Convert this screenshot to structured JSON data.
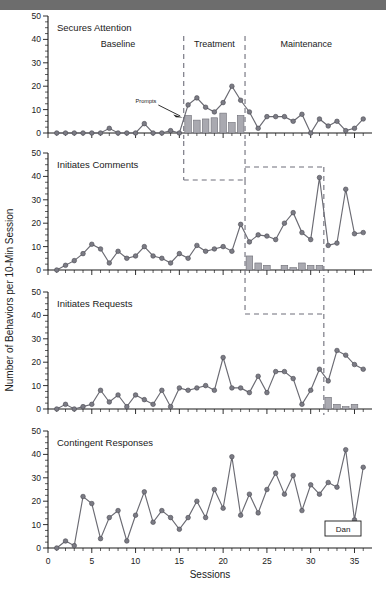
{
  "figure": {
    "ylabel": "Number of Behaviors per 10-Min Session",
    "xlabel": "Sessions",
    "subject_label": "Dan",
    "prompts_label": "Prompts",
    "colors": {
      "line": "#6b6b73",
      "marker": "#7b7b84",
      "bar": "#a9a9b0",
      "phase_line": "#6e6e7a",
      "axis": "#1a1a1a",
      "top_band": "#6d6d6d"
    }
  },
  "chart_data": [
    {
      "type": "line",
      "title": "Secures Attention",
      "panel_index": 0,
      "xlabel": "",
      "ylabel": "Number of Behaviors per 10-Min Session",
      "xlim": [
        0,
        37
      ],
      "ylim": [
        0,
        50
      ],
      "yticks": [
        0,
        10,
        20,
        30,
        40,
        50
      ],
      "grid": false,
      "phase_labels": [
        "Baseline",
        "Treatment",
        "Maintenance"
      ],
      "phase_label_x": [
        8,
        19,
        29.5
      ],
      "phase_lines": [
        15.5,
        22.5
      ],
      "x": [
        1,
        2,
        3,
        4,
        5,
        6,
        7,
        8,
        9,
        10,
        11,
        12,
        13,
        14,
        15,
        16,
        17,
        18,
        19,
        20,
        21,
        22,
        23,
        24,
        25,
        26,
        27,
        28,
        29,
        30,
        31,
        32,
        33,
        34,
        35,
        36
      ],
      "values": [
        0,
        0,
        0,
        0,
        0,
        0,
        2,
        0,
        0,
        0,
        4,
        0,
        0,
        1,
        0,
        0,
        12,
        15,
        11,
        9,
        13,
        20,
        14,
        9,
        2,
        7,
        7,
        7,
        7,
        5,
        8,
        0,
        6,
        3,
        5,
        5,
        1,
        2,
        2,
        6
      ],
      "series": [
        {
          "name": "Secures Attention",
          "x": [
            1,
            2,
            3,
            4,
            5,
            6,
            7,
            8,
            9,
            10,
            11,
            12,
            13,
            14,
            15,
            16,
            17,
            18,
            19,
            20,
            21,
            22,
            23,
            24,
            25,
            26,
            27,
            28,
            29,
            30,
            31,
            32,
            33,
            34,
            35,
            36
          ],
          "values": [
            0,
            0,
            0,
            0,
            0,
            0,
            2,
            0,
            0,
            0,
            4,
            0,
            0,
            1,
            0,
            12,
            15,
            11,
            9,
            13,
            20,
            14,
            9,
            2,
            7,
            7,
            7,
            5,
            8,
            0,
            6,
            3,
            5,
            1,
            2,
            6
          ]
        }
      ],
      "bars": {
        "name": "Prompts",
        "x": [
          16,
          17,
          18,
          19,
          20,
          21,
          22
        ],
        "values": [
          7.5,
          5.5,
          6,
          6.5,
          8.5,
          4.5,
          7.5
        ]
      },
      "annotations": [
        {
          "text": "Prompts",
          "x": 12.5,
          "y": 12
        }
      ]
    },
    {
      "type": "line",
      "title": "Initiates Comments",
      "panel_index": 1,
      "xlabel": "",
      "ylabel": "",
      "xlim": [
        0,
        37
      ],
      "ylim": [
        0,
        50
      ],
      "yticks": [
        0,
        10,
        20,
        30,
        40,
        50
      ],
      "grid": false,
      "phase_lines": [
        22.5,
        31.5
      ],
      "series": [
        {
          "name": "Initiates Comments",
          "x": [
            1,
            2,
            3,
            4,
            5,
            6,
            7,
            8,
            9,
            10,
            11,
            12,
            13,
            14,
            15,
            16,
            17,
            18,
            19,
            20,
            21,
            22,
            23,
            24,
            25,
            26,
            27,
            28,
            29,
            30,
            31,
            32,
            33,
            34,
            35,
            36
          ],
          "values": [
            0,
            2,
            4,
            7,
            11,
            9,
            3,
            8,
            5,
            6,
            10,
            6,
            5,
            3,
            7,
            5,
            10.5,
            8,
            9,
            10,
            8,
            19.5,
            12,
            15,
            14.5,
            13,
            20,
            24.5,
            16,
            13,
            39.5,
            10.5,
            11.5,
            34.5,
            15.5,
            16,
            29
          ]
        }
      ],
      "bars": {
        "name": "Prompts",
        "x": [
          23,
          24,
          25,
          27,
          28,
          29,
          30,
          31
        ],
        "values": [
          6,
          3,
          2,
          2,
          1,
          3,
          2,
          2
        ]
      }
    },
    {
      "type": "line",
      "title": "Initiates Requests",
      "panel_index": 2,
      "xlabel": "",
      "ylabel": "",
      "xlim": [
        0,
        37
      ],
      "ylim": [
        0,
        50
      ],
      "yticks": [
        0,
        10,
        20,
        30,
        40,
        50
      ],
      "grid": false,
      "phase_lines": [
        31.5
      ],
      "series": [
        {
          "name": "Initiates Requests",
          "x": [
            1,
            2,
            3,
            4,
            5,
            6,
            7,
            8,
            9,
            10,
            11,
            12,
            13,
            14,
            15,
            16,
            17,
            18,
            19,
            20,
            21,
            22,
            23,
            24,
            25,
            26,
            27,
            28,
            29,
            30,
            31,
            32,
            33,
            34,
            35,
            36
          ],
          "values": [
            0,
            2,
            0,
            1,
            2,
            8,
            3,
            6,
            1,
            6,
            4,
            2,
            8,
            1,
            9,
            8,
            9,
            10,
            8,
            22,
            9,
            9,
            7,
            14,
            7,
            16,
            16,
            13,
            2,
            8,
            17,
            12,
            25,
            23,
            19,
            17,
            30
          ]
        }
      ],
      "bars": {
        "name": "Prompts",
        "x": [
          32,
          33,
          34,
          35
        ],
        "values": [
          5,
          2,
          1,
          2
        ]
      }
    },
    {
      "type": "line",
      "title": "Contingent Responses",
      "panel_index": 3,
      "xlabel": "Sessions",
      "ylabel": "",
      "xlim": [
        0,
        37
      ],
      "ylim": [
        0,
        50
      ],
      "yticks": [
        0,
        10,
        20,
        30,
        40,
        50
      ],
      "xticks": [
        0,
        5,
        10,
        15,
        20,
        25,
        30,
        35
      ],
      "grid": false,
      "series": [
        {
          "name": "Contingent Responses",
          "x": [
            1,
            2,
            3,
            4,
            5,
            6,
            7,
            8,
            9,
            10,
            11,
            12,
            13,
            14,
            15,
            16,
            17,
            18,
            19,
            20,
            21,
            22,
            23,
            24,
            25,
            26,
            27,
            28,
            29,
            30,
            31,
            32,
            33,
            34,
            35,
            36
          ],
          "values": [
            0,
            3,
            1,
            22,
            19,
            4,
            13,
            16,
            3,
            14,
            24,
            11,
            16,
            13,
            8,
            13,
            20,
            13,
            25,
            17,
            39,
            14,
            23,
            15,
            25,
            32,
            23,
            31,
            16,
            27,
            23,
            28,
            26,
            42,
            12,
            34.5
          ]
        }
      ]
    }
  ]
}
